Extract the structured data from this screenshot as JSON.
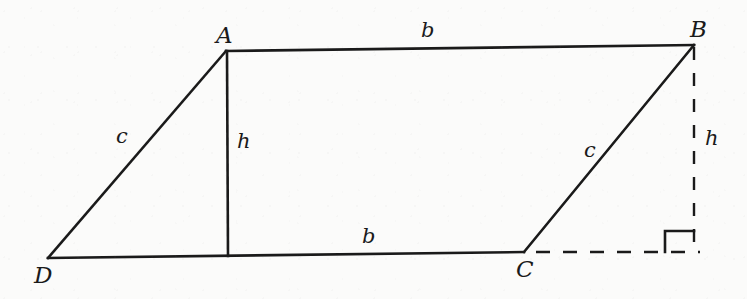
{
  "figure": {
    "kind": "geometry-diagram",
    "shape": "parallelogram",
    "background_color": "#fbfbfa",
    "stroke_color": "#1a1a1a",
    "vertices": [
      {
        "name": "A",
        "label": "A",
        "x": 226,
        "y": 51,
        "label_x": 216,
        "label_y": 24
      },
      {
        "name": "B",
        "label": "B",
        "x": 694,
        "y": 45,
        "label_x": 690,
        "label_y": 18
      },
      {
        "name": "C",
        "label": "C",
        "x": 524,
        "y": 252,
        "label_x": 516,
        "label_y": 258
      },
      {
        "name": "D",
        "label": "D",
        "x": 48,
        "y": 258,
        "label_x": 34,
        "label_y": 264
      }
    ],
    "solid_edges": [
      {
        "name": "edge-AB",
        "from": "A",
        "to": "B",
        "x1": 226,
        "y1": 51,
        "x2": 694,
        "y2": 45
      },
      {
        "name": "edge-BC",
        "from": "B",
        "to": "C",
        "x1": 694,
        "y1": 45,
        "x2": 524,
        "y2": 252
      },
      {
        "name": "edge-CD",
        "from": "C",
        "to": "D",
        "x1": 524,
        "y1": 252,
        "x2": 48,
        "y2": 258
      },
      {
        "name": "edge-DA",
        "from": "D",
        "to": "A",
        "x1": 48,
        "y1": 258,
        "x2": 226,
        "y2": 51
      },
      {
        "name": "altitude-inner",
        "from": "A",
        "to": "base",
        "x1": 227,
        "y1": 51,
        "x2": 228,
        "y2": 256
      }
    ],
    "dashed_edges": [
      {
        "name": "altitude-outer",
        "from": "B",
        "to": "foot",
        "x1": 694,
        "y1": 45,
        "x2": 694,
        "y2": 252
      },
      {
        "name": "base-extension",
        "from": "C",
        "to": "foot",
        "x1": 536,
        "y1": 252,
        "x2": 700,
        "y2": 252
      }
    ],
    "right_angle": {
      "name": "right-angle-marker",
      "points": "665,252 665,231 694,231",
      "size": 21
    },
    "side_labels": [
      {
        "name": "label-b-top",
        "text": "b",
        "x": 421,
        "y": 20
      },
      {
        "name": "label-b-bottom",
        "text": "b",
        "x": 362,
        "y": 226
      },
      {
        "name": "label-c-left",
        "text": "c",
        "x": 116,
        "y": 126
      },
      {
        "name": "label-c-right",
        "text": "c",
        "x": 584,
        "y": 140
      },
      {
        "name": "label-h-inner",
        "text": "h",
        "x": 237,
        "y": 131
      },
      {
        "name": "label-h-outer",
        "text": "h",
        "x": 705,
        "y": 128
      }
    ]
  }
}
